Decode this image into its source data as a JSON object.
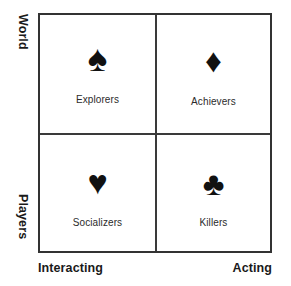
{
  "diagram": {
    "type": "2x2-matrix",
    "colors": {
      "background": "#ffffff",
      "border": "#333333",
      "divider": "#3a3a3a",
      "icon": "#111111",
      "axis_label_text": "#1a1a1a",
      "quadrant_label_text": "#2b2b2b"
    },
    "axes": {
      "vertical": {
        "top_label": "World",
        "bottom_label": "Players"
      },
      "horizontal": {
        "left_label": "Interacting",
        "right_label": "Acting"
      }
    },
    "quadrants": [
      {
        "id": "top-left",
        "label": "Explorers",
        "icon_name": "spade-icon",
        "icon_glyph": "♠"
      },
      {
        "id": "top-right",
        "label": "Achievers",
        "icon_name": "diamond-icon",
        "icon_glyph": "♦"
      },
      {
        "id": "bottom-left",
        "label": "Socializers",
        "icon_name": "heart-icon",
        "icon_glyph": "♥"
      },
      {
        "id": "bottom-right",
        "label": "Killers",
        "icon_name": "club-icon",
        "icon_glyph": "♣"
      }
    ]
  }
}
